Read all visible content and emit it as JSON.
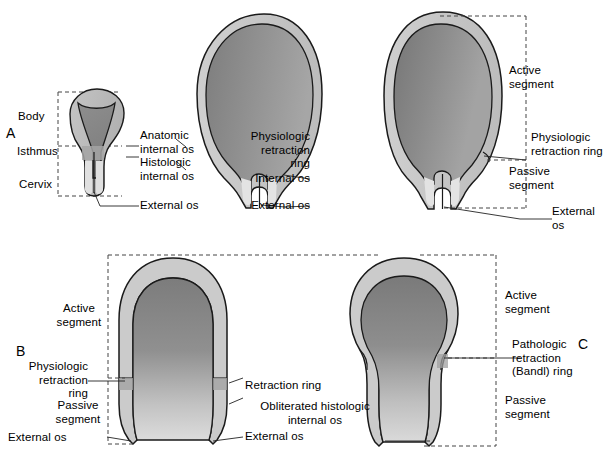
{
  "diagram": {
    "panels": [
      {
        "id": "A",
        "letter": "A"
      },
      {
        "id": "B",
        "letter": "B"
      },
      {
        "id": "C",
        "letter": "C"
      }
    ]
  },
  "colors": {
    "outline": "#1a1a1a",
    "myometrium_light": "#c9c9c9",
    "cavity_dark": "#8a8a8a",
    "cavity_mid": "#9e9e9e",
    "cervix_light": "#dcdcdc",
    "isthmus_band": "#a8a8a8",
    "dashed_guide": "#555555",
    "leader_line": "#222222",
    "background": "#ffffff"
  },
  "panel_a": {
    "letter": "A",
    "labels": {
      "body": "Body",
      "isthmus": "Isthmus",
      "cervix": "Cervix",
      "anatomic_internal_os": "Anatomic\ninternal os",
      "histologic_internal_os": "Histologic\ninternal os",
      "external_os": "External os"
    }
  },
  "panel_b_top": {
    "labels": {
      "physiologic_retraction_ring": "Physiologic\nretraction\nring",
      "internal_os": "Internal os",
      "external_os": "External os"
    }
  },
  "panel_c_top": {
    "labels": {
      "active_segment": "Active\nsegment",
      "physiologic_retraction_ring": "Physiologic\nretraction ring",
      "passive_segment": "Passive\nsegment",
      "external_os": "External\nos"
    }
  },
  "panel_b": {
    "letter": "B",
    "labels": {
      "active_segment": "Active\nsegment",
      "physiologic_retraction_ring": "Physiologic\nretraction\nring",
      "passive_segment": "Passive\nsegment",
      "external_os": "External os",
      "retraction_ring": "Retraction ring",
      "obliterated_histologic_internal_os": "Obliterated histologic\ninternal os",
      "external_os_center": "External os"
    }
  },
  "panel_c": {
    "letter": "C",
    "labels": {
      "active_segment": "Active\nsegment",
      "pathologic_retraction_ring": "Pathologic\nretraction\n(Bandl) ring",
      "passive_segment": "Passive\nsegment"
    }
  }
}
